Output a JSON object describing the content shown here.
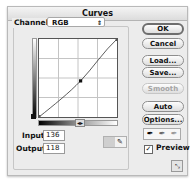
{
  "window": {
    "title": "Curves"
  },
  "channel": {
    "label": "Channel:",
    "value": "RGB"
  },
  "curve": {
    "grid_divisions": 4,
    "points": [
      [
        0,
        0
      ],
      [
        136,
        118
      ],
      [
        255,
        255
      ]
    ],
    "selected_point": {
      "input": 136,
      "output": 118
    }
  },
  "fields": {
    "input_label": "Input:",
    "input_value": "136",
    "output_label": "Output:",
    "output_value": "118"
  },
  "buttons": {
    "ok": "OK",
    "cancel": "Cancel",
    "load": "Load...",
    "save": "Save...",
    "smooth": "Smooth",
    "auto": "Auto",
    "options": "Options..."
  },
  "eyedroppers": [
    "black-point-eyedropper",
    "gray-point-eyedropper",
    "white-point-eyedropper"
  ],
  "preview": {
    "label": "Preview",
    "checked": true
  },
  "icons": {
    "dropper": "✒",
    "checkmark": "✓",
    "select_arrows": "⇕",
    "expand": "⤡"
  }
}
